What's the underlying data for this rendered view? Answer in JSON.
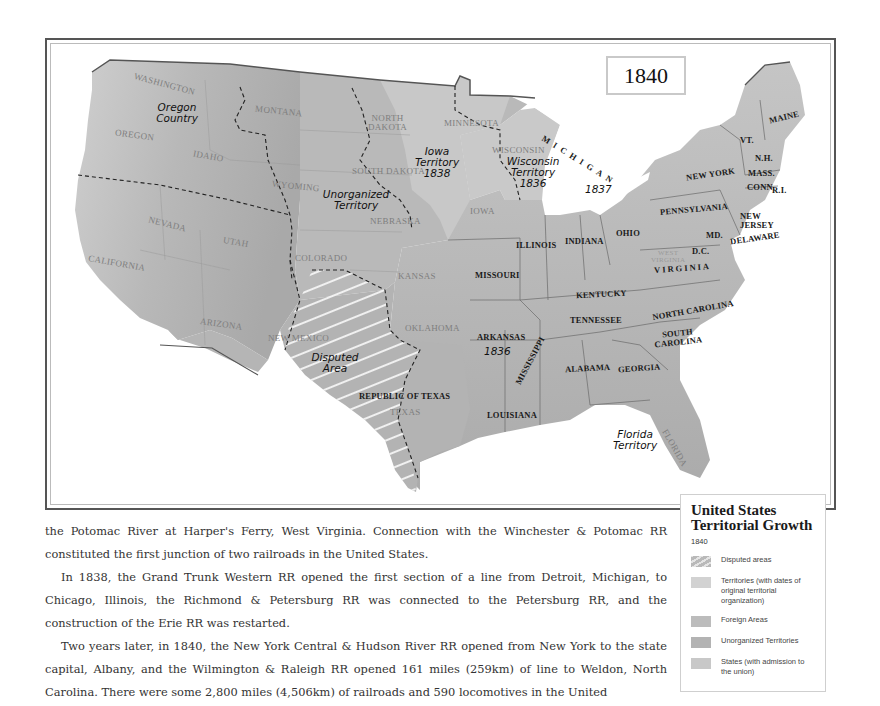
{
  "map": {
    "year_box": "1840",
    "territory_labels": {
      "oregon_country": "Oregon\nCountry",
      "iowa_territory": "Iowa\nTerritory\n1838",
      "wisconsin_territory": "Wisconsin\nTerritory\n1836",
      "unorganized_territory": "Unorganized\nTerritory",
      "disputed_area": "Disputed\nArea",
      "florida_territory": "Florida\nTerritory",
      "arkansas_year": "1836",
      "michigan_year": "1837"
    },
    "state_labels_dark": {
      "michigan": "MICHIGAN",
      "maine": "MAINE",
      "vt": "VT.",
      "nh": "N.H.",
      "mass": "MASS.",
      "conn": "CONN.",
      "ri": "R.I.",
      "new_york": "NEW YORK",
      "pennsylvania": "PENNSYLVANIA",
      "new_jersey": "NEW\nJERSEY",
      "delaware": "DELAWARE",
      "md": "MD.",
      "dc": "D.C.",
      "virginia": "VIRGINIA",
      "ohio": "OHIO",
      "indiana": "INDIANA",
      "illinois": "ILLINOIS",
      "missouri": "MISSOURI",
      "kentucky": "KENTUCKY",
      "tennessee": "TENNESSEE",
      "north_carolina": "NORTH CAROLINA",
      "south_carolina": "SOUTH\nCAROLINA",
      "georgia": "GEORGIA",
      "alabama": "ALABAMA",
      "mississippi": "MISSISSIPPI",
      "louisiana": "LOUISIANA",
      "arkansas": "ARKANSAS",
      "republic_of_texas": "REPUBLIC OF TEXAS"
    },
    "state_labels_light": {
      "washington": "WASHINGTON",
      "oregon": "OREGON",
      "idaho": "IDAHO",
      "montana": "MONTANA",
      "wyoming": "WYOMING",
      "nevada": "NEVADA",
      "utah": "UTAH",
      "california": "CALIFORNIA",
      "colorado": "COLORADO",
      "arizona": "ARIZONA",
      "new_mexico": "NEW MEXICO",
      "north_dakota": "NORTH\nDAKOTA",
      "south_dakota": "SOUTH DAKOTA",
      "minnesota": "MINNESOTA",
      "wisconsin": "WISCONSIN",
      "nebraska": "NEBRASKA",
      "iowa": "IOWA",
      "kansas": "KANSAS",
      "oklahoma": "OKLAHOMA",
      "texas": "TEXAS",
      "west_virginia": "WEST\nVIRGINIA",
      "florida": "FLORIDA"
    }
  },
  "legend": {
    "title": "United States Territorial Growth",
    "year": "1840",
    "items": [
      {
        "label": "Disputed areas",
        "swatch": "hatched",
        "color": "#b9b9b9"
      },
      {
        "label": "Territories (with dates of original territorial organization)",
        "swatch": "solid",
        "color": "#d2d2d2"
      },
      {
        "label": "Foreign Areas",
        "swatch": "solid",
        "color": "#bcbcbc"
      },
      {
        "label": "Unorganized Territories",
        "swatch": "solid",
        "color": "#b3b3b3"
      },
      {
        "label": "States (with admission to the union)",
        "swatch": "solid",
        "color": "#c8c8c8"
      }
    ]
  },
  "body_text": {
    "paragraphs": [
      "the Potomac River at Harper's Ferry, West Virginia. Connection with the Winchester & Potomac RR constituted the first junction of two railroads in the United States.",
      "In 1838, the Grand Trunk Western RR opened the first section of a line from Detroit, Michigan, to Chicago, Illinois, the Richmond & Petersburg RR was connected to the Petersburg RR, and the construction of the Erie RR was restarted.",
      "Two years later, in 1840, the New York Central & Hudson River RR opened from New York to the state capital, Albany, and the Wilmington & Raleigh RR opened 161 miles (259km) of line to Weldon, North Carolina. There were some 2,800 miles (4,506km) of railroads and 590 locomotives in the United"
    ]
  },
  "colors": {
    "foreign": "#a9a9a9",
    "unorganized": "#b4b4b4",
    "territory": "#c6c6c6",
    "state": "#bdbdbd",
    "water": "#ffffff",
    "frame": "#555555"
  }
}
